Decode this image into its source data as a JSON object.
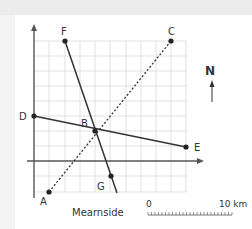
{
  "diagram": {
    "points": {
      "F": "F",
      "C": "C",
      "D": "D",
      "B": "B",
      "E": "E",
      "G": "G",
      "A": "A"
    },
    "place_label": "Mearnside",
    "north_label": "N",
    "scale": {
      "start": "0",
      "end": "10 km"
    },
    "lines": [
      {
        "from": "F",
        "to": "G",
        "style": "solid"
      },
      {
        "from": "D",
        "to": "E",
        "style": "solid"
      },
      {
        "from": "A",
        "to": "C",
        "style": "dotted"
      }
    ]
  }
}
